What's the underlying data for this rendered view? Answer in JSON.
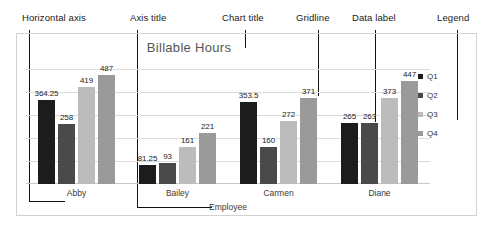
{
  "annotations": [
    {
      "id": "horizontal-axis",
      "label": "Horizontal axis"
    },
    {
      "id": "axis-title",
      "label": "Axis title"
    },
    {
      "id": "chart-title",
      "label": "Chart title"
    },
    {
      "id": "gridline",
      "label": "Gridline"
    },
    {
      "id": "data-label",
      "label": "Data label"
    },
    {
      "id": "legend",
      "label": "Legend"
    }
  ],
  "colors": {
    "q1": "#1c1c1c",
    "q2": "#4a4a4a",
    "q3": "#bcbcbc",
    "q4": "#9a9a9a",
    "gridline": "#dcdcdc",
    "leader": "#111111",
    "frame": "#d2d2d2",
    "title": "#555555"
  },
  "chart_data": {
    "type": "bar",
    "title": "Billable Hours",
    "xlabel": "Employee",
    "ylabel": "",
    "categories": [
      "Abby",
      "Bailey",
      "Carmen",
      "Diane"
    ],
    "series": [
      {
        "name": "Q1",
        "values": [
          364.25,
          81.25,
          353.5,
          265
        ]
      },
      {
        "name": "Q2",
        "values": [
          258,
          93,
          160,
          263
        ]
      },
      {
        "name": "Q3",
        "values": [
          419,
          161,
          272,
          373
        ]
      },
      {
        "name": "Q4",
        "values": [
          487,
          221,
          371,
          447
        ]
      }
    ],
    "data_labels": [
      [
        "364.25",
        "258",
        "419",
        "487"
      ],
      [
        "81.25",
        "93",
        "161",
        "221"
      ],
      [
        "353.5",
        "160",
        "272",
        "371"
      ],
      [
        "265",
        "263",
        "373",
        "447"
      ]
    ],
    "ylim": [
      0,
      520
    ],
    "gridlines": [
      100,
      200,
      300,
      400,
      500
    ],
    "grid": true,
    "legend_position": "right"
  }
}
